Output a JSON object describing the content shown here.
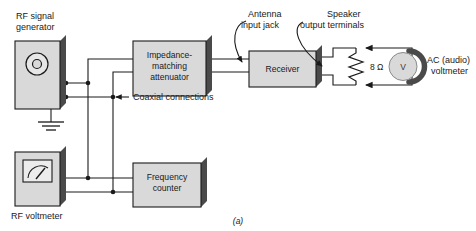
{
  "figure": {
    "caption": "(a)",
    "background": "#ffffff",
    "ink": "#1a1a1a",
    "box_fill": "#d9d9d9",
    "box_shadow": "#4a4a4a",
    "meter_fill": "#d0d0d0"
  },
  "blocks": {
    "rf_signal_generator": {
      "label_line1": "RF signal",
      "label_line2": "generator"
    },
    "impedance_attenuator": {
      "line1": "Impedance-",
      "line2": "matching",
      "line3": "attenuator"
    },
    "receiver": {
      "label": "Receiver"
    },
    "frequency_counter": {
      "line1": "Frequency",
      "line2": "counter"
    },
    "rf_voltmeter": {
      "label": "RF voltmeter"
    }
  },
  "annotations": {
    "antenna_jack": {
      "line1": "Antenna",
      "line2": "input jack"
    },
    "speaker_terminals": {
      "line1": "Speaker",
      "line2": "output terminals"
    },
    "coaxial": {
      "label": "Coaxial connections"
    },
    "ac_voltmeter": {
      "line1": "AC (audio)",
      "line2": "voltmeter"
    }
  },
  "components": {
    "load_resistor": {
      "value": "8 Ω"
    },
    "voltmeter_symbol": {
      "label": "V"
    }
  }
}
